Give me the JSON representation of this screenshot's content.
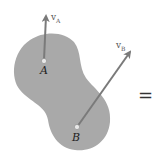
{
  "diagram": {
    "body": {
      "color": "#a8a8a8"
    },
    "points": [
      {
        "id": "A",
        "label": "A"
      },
      {
        "id": "B",
        "label": "B"
      }
    ],
    "vectors": [
      {
        "id": "vA",
        "symbol": "v",
        "subscript": "A",
        "color": "#777777"
      },
      {
        "id": "vB",
        "symbol": "v",
        "subscript": "B",
        "color": "#777777"
      }
    ],
    "operator": "="
  }
}
